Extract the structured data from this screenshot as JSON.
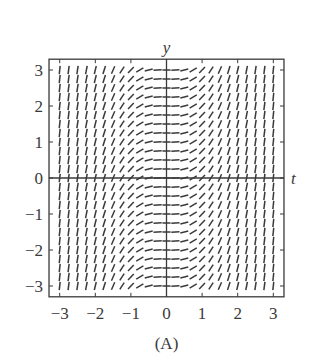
{
  "figure": {
    "caption": "(A)",
    "x_axis_label": "t",
    "y_axis_label": "y",
    "colors": {
      "ink": "#3a3a3a",
      "background": "#ffffff"
    }
  },
  "chart_data": {
    "type": "slope_field",
    "title": "",
    "caption": "(A)",
    "xlabel": "t",
    "ylabel": "y",
    "xlim": [
      -3.3,
      3.3
    ],
    "ylim": [
      -3.3,
      3.3
    ],
    "x_ticks": [
      -3,
      -2,
      -1,
      0,
      1,
      2,
      3
    ],
    "y_ticks": [
      -3,
      -2,
      -1,
      0,
      1,
      2,
      3
    ],
    "x_tick_labels": [
      "−3",
      "−2",
      "−1",
      "0",
      "1",
      "2",
      "3"
    ],
    "y_tick_labels": [
      "−3",
      "−2",
      "−1",
      "0",
      "1",
      "2",
      "3"
    ],
    "grid": false,
    "axes_through_origin": true,
    "field_description": "Slope depends only on t; all slopes non-negative, zero along t = 0, becoming nearly vertical near |t| = 3 (consistent with dy/dt = t^2)",
    "sample_step": 0.25,
    "t_samples": [
      -3,
      -2.75,
      -2.5,
      -2.25,
      -2,
      -1.75,
      -1.5,
      -1.25,
      -1,
      -0.75,
      -0.5,
      -0.25,
      0,
      0.25,
      0.5,
      0.75,
      1,
      1.25,
      1.5,
      1.75,
      2,
      2.25,
      2.5,
      2.75,
      3
    ],
    "y_samples": [
      -3,
      -2.75,
      -2.5,
      -2.25,
      -2,
      -1.75,
      -1.5,
      -1.25,
      -1,
      -0.75,
      -0.5,
      -0.25,
      0,
      0.25,
      0.5,
      0.75,
      1,
      1.25,
      1.5,
      1.75,
      2,
      2.25,
      2.5,
      2.75,
      3
    ],
    "slope_by_t": [
      9,
      7.5625,
      6.25,
      5.0625,
      4,
      3.0625,
      2.25,
      1.5625,
      1,
      0.5625,
      0.25,
      0.0625,
      0,
      0.0625,
      0.25,
      0.5625,
      1,
      1.5625,
      2.25,
      3.0625,
      4,
      5.0625,
      6.25,
      7.5625,
      9
    ]
  }
}
